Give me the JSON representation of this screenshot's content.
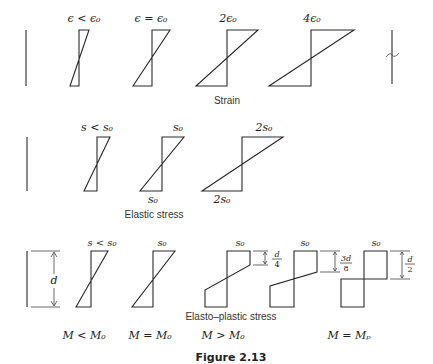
{
  "figure": {
    "caption": "Figure 2.13",
    "rows": {
      "strain": {
        "title": "Strain",
        "labels": [
          "ϵ < ϵ₀",
          "ϵ = ϵ₀",
          "2ϵ₀",
          "4ϵ₀"
        ]
      },
      "elastic": {
        "title": "Elastic stress",
        "top_labels": [
          "s < s₀",
          "s₀",
          "2s₀"
        ],
        "bottom_labels": [
          "s₀",
          "2s₀"
        ]
      },
      "elasto_plastic": {
        "title": "Elasto–plastic stress",
        "top_labels": [
          "s < s₀",
          "s₀",
          "s₀",
          "s₀",
          "s₀"
        ],
        "depth_label": "d",
        "plastic_zone_labels": {
          "a": {
            "num": "d",
            "den": "4"
          },
          "b": {
            "num": "3d",
            "den": "8"
          },
          "c": {
            "num": "d",
            "den": "2"
          }
        },
        "moment_labels": [
          "M < M₀",
          "M = M₀",
          "M > M₀",
          "M = Mₚ"
        ]
      }
    }
  }
}
